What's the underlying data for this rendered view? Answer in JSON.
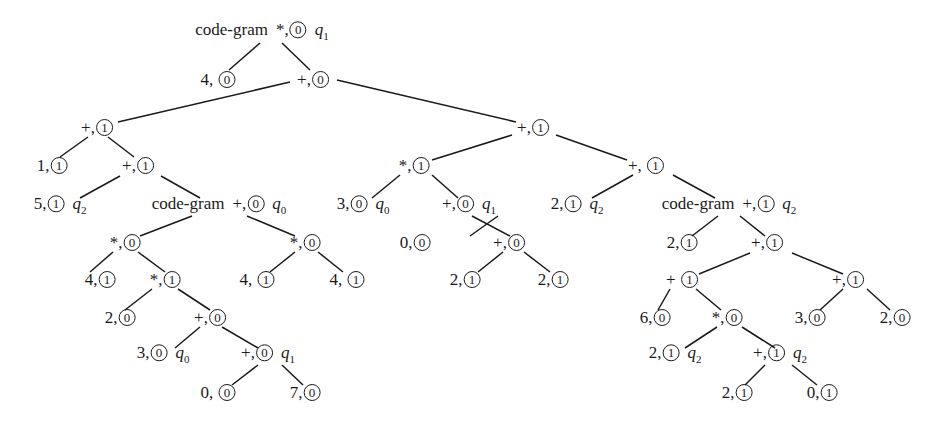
{
  "diagram": {
    "type": "tree",
    "nodes": [
      {
        "id": "n0",
        "prefix": "code-gram",
        "label": "*,",
        "bit": "0",
        "state": "q",
        "state_sub": "1",
        "x": 262,
        "y": 33
      },
      {
        "id": "n1",
        "prefix": "",
        "label": "4, ",
        "bit": "0",
        "state": "",
        "state_sub": "",
        "x": 218,
        "y": 80
      },
      {
        "id": "n2",
        "prefix": "",
        "label": "+,",
        "bit": "0",
        "state": "",
        "state_sub": "",
        "x": 313,
        "y": 80
      },
      {
        "id": "n3",
        "prefix": "",
        "label": "+,",
        "bit": "1",
        "state": "",
        "state_sub": "",
        "x": 97,
        "y": 128
      },
      {
        "id": "n4",
        "prefix": "",
        "label": "+,",
        "bit": "1",
        "state": "",
        "state_sub": "",
        "x": 533,
        "y": 128
      },
      {
        "id": "n5",
        "prefix": "",
        "label": "1,",
        "bit": "1",
        "state": "",
        "state_sub": "",
        "x": 52,
        "y": 166
      },
      {
        "id": "n6",
        "prefix": "",
        "label": "+,",
        "bit": "1",
        "state": "",
        "state_sub": "",
        "x": 138,
        "y": 166
      },
      {
        "id": "n7",
        "prefix": "",
        "label": "*,",
        "bit": "1",
        "state": "",
        "state_sub": "",
        "x": 414,
        "y": 166
      },
      {
        "id": "n8",
        "prefix": "",
        "label": "+, ",
        "bit": "1",
        "state": "",
        "state_sub": "",
        "x": 646,
        "y": 166
      },
      {
        "id": "n9",
        "prefix": "",
        "label": "5,",
        "bit": "1",
        "state": "q",
        "state_sub": "2",
        "x": 60,
        "y": 207
      },
      {
        "id": "n10",
        "prefix": "code-gram",
        "label": "+,",
        "bit": "0",
        "state": "q",
        "state_sub": "0",
        "x": 219,
        "y": 207
      },
      {
        "id": "n11",
        "prefix": "",
        "label": "3,",
        "bit": "0",
        "state": "q",
        "state_sub": "0",
        "x": 363,
        "y": 207
      },
      {
        "id": "n12",
        "prefix": "",
        "label": "+,",
        "bit": "0",
        "state": "q",
        "state_sub": "1",
        "x": 469,
        "y": 207
      },
      {
        "id": "n13",
        "prefix": "",
        "label": "2,",
        "bit": "1",
        "state": "q",
        "state_sub": "2",
        "x": 577,
        "y": 207
      },
      {
        "id": "n14",
        "prefix": "code-gram",
        "label": "+,",
        "bit": "1",
        "state": "q",
        "state_sub": "2",
        "x": 729,
        "y": 207
      },
      {
        "id": "n15",
        "prefix": "",
        "label": "*,",
        "bit": "0",
        "state": "",
        "state_sub": "",
        "x": 125,
        "y": 243
      },
      {
        "id": "n16",
        "prefix": "",
        "label": "*,",
        "bit": "0",
        "state": "",
        "state_sub": "",
        "x": 305,
        "y": 243
      },
      {
        "id": "n17",
        "prefix": "",
        "label": "0,",
        "bit": "0",
        "state": "",
        "state_sub": "",
        "x": 415,
        "y": 243
      },
      {
        "id": "n18",
        "prefix": "",
        "label": "+,",
        "bit": "0",
        "state": "",
        "state_sub": "",
        "x": 509,
        "y": 243
      },
      {
        "id": "n19",
        "prefix": "",
        "label": "2,",
        "bit": "1",
        "state": "",
        "state_sub": "",
        "x": 682,
        "y": 243
      },
      {
        "id": "n20",
        "prefix": "",
        "label": "+,",
        "bit": "1",
        "state": "",
        "state_sub": "",
        "x": 767,
        "y": 243
      },
      {
        "id": "n21",
        "prefix": "",
        "label": "4,",
        "bit": "1",
        "state": "",
        "state_sub": "",
        "x": 100,
        "y": 280
      },
      {
        "id": "n22",
        "prefix": "",
        "label": "*,",
        "bit": "1",
        "state": "",
        "state_sub": "",
        "x": 165,
        "y": 280
      },
      {
        "id": "n23",
        "prefix": "",
        "label": "4, ",
        "bit": "1",
        "state": "",
        "state_sub": "",
        "x": 257,
        "y": 280
      },
      {
        "id": "n24",
        "prefix": "",
        "label": "4, ",
        "bit": "1",
        "state": "",
        "state_sub": "",
        "x": 347,
        "y": 280
      },
      {
        "id": "n25",
        "prefix": "",
        "label": "2,",
        "bit": "1",
        "state": "",
        "state_sub": "",
        "x": 465,
        "y": 280
      },
      {
        "id": "n26",
        "prefix": "",
        "label": "2,",
        "bit": "1",
        "state": "",
        "state_sub": "",
        "x": 553,
        "y": 280
      },
      {
        "id": "n27",
        "prefix": "",
        "label": "+ ",
        "bit": "1",
        "state": "",
        "state_sub": "",
        "x": 682,
        "y": 280
      },
      {
        "id": "n28",
        "prefix": "",
        "label": "+,",
        "bit": "1",
        "state": "",
        "state_sub": "",
        "x": 848,
        "y": 280
      },
      {
        "id": "n29",
        "prefix": "",
        "label": "2,",
        "bit": "0",
        "state": "",
        "state_sub": "",
        "x": 120,
        "y": 318
      },
      {
        "id": "n30",
        "prefix": "",
        "label": "+,",
        "bit": "0",
        "state": "",
        "state_sub": "",
        "x": 210,
        "y": 318
      },
      {
        "id": "n31",
        "prefix": "",
        "label": "6,",
        "bit": "0",
        "state": "",
        "state_sub": "",
        "x": 655,
        "y": 318
      },
      {
        "id": "n32",
        "prefix": "",
        "label": "*,",
        "bit": "0",
        "state": "",
        "state_sub": "",
        "x": 727,
        "y": 318
      },
      {
        "id": "n33",
        "prefix": "",
        "label": "3,",
        "bit": "0",
        "state": "",
        "state_sub": "",
        "x": 810,
        "y": 318
      },
      {
        "id": "n34",
        "prefix": "",
        "label": "2,",
        "bit": "0",
        "state": "",
        "state_sub": "",
        "x": 895,
        "y": 318
      },
      {
        "id": "n35",
        "prefix": "",
        "label": "3,",
        "bit": "0",
        "state": "q",
        "state_sub": "0",
        "x": 163,
        "y": 356
      },
      {
        "id": "n36",
        "prefix": "",
        "label": "+,",
        "bit": "0",
        "state": "q",
        "state_sub": "1",
        "x": 268,
        "y": 356
      },
      {
        "id": "n37",
        "prefix": "",
        "label": "2,",
        "bit": "1",
        "state": "q",
        "state_sub": "2",
        "x": 675,
        "y": 356
      },
      {
        "id": "n38",
        "prefix": "",
        "label": "+,",
        "bit": "1",
        "state": "q",
        "state_sub": "2",
        "x": 780,
        "y": 356
      },
      {
        "id": "n39",
        "prefix": "",
        "label": "0, ",
        "bit": "0",
        "state": "",
        "state_sub": "",
        "x": 218,
        "y": 393
      },
      {
        "id": "n40",
        "prefix": "",
        "label": "7,",
        "bit": "0",
        "state": "",
        "state_sub": "",
        "x": 305,
        "y": 393
      },
      {
        "id": "n41",
        "prefix": "",
        "label": "2,",
        "bit": "1",
        "state": "",
        "state_sub": "",
        "x": 737,
        "y": 393
      },
      {
        "id": "n42",
        "prefix": "",
        "label": "0,",
        "bit": "1",
        "state": "",
        "state_sub": "",
        "x": 822,
        "y": 393
      }
    ],
    "edges": [
      {
        "x1": 260,
        "y1": 43,
        "x2": 229,
        "y2": 70
      },
      {
        "x1": 282,
        "y1": 43,
        "x2": 310,
        "y2": 70
      },
      {
        "x1": 290,
        "y1": 82,
        "x2": 118,
        "y2": 122
      },
      {
        "x1": 337,
        "y1": 80,
        "x2": 516,
        "y2": 122
      },
      {
        "x1": 88,
        "y1": 137,
        "x2": 60,
        "y2": 157
      },
      {
        "x1": 108,
        "y1": 137,
        "x2": 134,
        "y2": 157
      },
      {
        "x1": 120,
        "y1": 176,
        "x2": 80,
        "y2": 198
      },
      {
        "x1": 161,
        "y1": 176,
        "x2": 200,
        "y2": 198
      },
      {
        "x1": 512,
        "y1": 135,
        "x2": 432,
        "y2": 160
      },
      {
        "x1": 556,
        "y1": 135,
        "x2": 627,
        "y2": 160
      },
      {
        "x1": 400,
        "y1": 175,
        "x2": 372,
        "y2": 198
      },
      {
        "x1": 432,
        "y1": 175,
        "x2": 458,
        "y2": 198
      },
      {
        "x1": 633,
        "y1": 175,
        "x2": 592,
        "y2": 198
      },
      {
        "x1": 673,
        "y1": 175,
        "x2": 715,
        "y2": 198
      },
      {
        "x1": 192,
        "y1": 216,
        "x2": 140,
        "y2": 236
      },
      {
        "x1": 247,
        "y1": 216,
        "x2": 295,
        "y2": 236
      },
      {
        "x1": 113,
        "y1": 252,
        "x2": 90,
        "y2": 272
      },
      {
        "x1": 138,
        "y1": 252,
        "x2": 165,
        "y2": 272
      },
      {
        "x1": 295,
        "y1": 252,
        "x2": 270,
        "y2": 272
      },
      {
        "x1": 318,
        "y1": 252,
        "x2": 343,
        "y2": 272
      },
      {
        "x1": 152,
        "y1": 289,
        "x2": 125,
        "y2": 310
      },
      {
        "x1": 178,
        "y1": 289,
        "x2": 210,
        "y2": 310
      },
      {
        "x1": 200,
        "y1": 327,
        "x2": 175,
        "y2": 348
      },
      {
        "x1": 222,
        "y1": 327,
        "x2": 258,
        "y2": 348
      },
      {
        "x1": 258,
        "y1": 365,
        "x2": 232,
        "y2": 385
      },
      {
        "x1": 282,
        "y1": 365,
        "x2": 303,
        "y2": 385
      },
      {
        "x1": 498,
        "y1": 216,
        "x2": 470,
        "y2": 236
      },
      {
        "x1": 472,
        "y1": 216,
        "x2": 510,
        "y2": 236
      },
      {
        "x1": 503,
        "y1": 252,
        "x2": 478,
        "y2": 272
      },
      {
        "x1": 524,
        "y1": 252,
        "x2": 550,
        "y2": 272
      },
      {
        "x1": 718,
        "y1": 216,
        "x2": 692,
        "y2": 236
      },
      {
        "x1": 740,
        "y1": 216,
        "x2": 765,
        "y2": 236
      },
      {
        "x1": 750,
        "y1": 253,
        "x2": 699,
        "y2": 274
      },
      {
        "x1": 792,
        "y1": 253,
        "x2": 843,
        "y2": 274
      },
      {
        "x1": 670,
        "y1": 289,
        "x2": 658,
        "y2": 310
      },
      {
        "x1": 696,
        "y1": 289,
        "x2": 721,
        "y2": 310
      },
      {
        "x1": 843,
        "y1": 289,
        "x2": 820,
        "y2": 310
      },
      {
        "x1": 867,
        "y1": 289,
        "x2": 890,
        "y2": 310
      },
      {
        "x1": 717,
        "y1": 327,
        "x2": 685,
        "y2": 348
      },
      {
        "x1": 742,
        "y1": 327,
        "x2": 775,
        "y2": 348
      },
      {
        "x1": 765,
        "y1": 365,
        "x2": 745,
        "y2": 385
      },
      {
        "x1": 792,
        "y1": 365,
        "x2": 817,
        "y2": 385
      }
    ]
  }
}
